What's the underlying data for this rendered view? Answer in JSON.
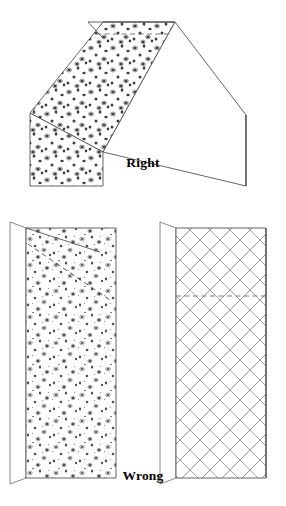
{
  "figure": {
    "kind": "technical-illustration",
    "background_color": "#ffffff",
    "line_color": "#4a4a4a",
    "dash_color": "#6d6d6d",
    "stipple_color": "#555555",
    "hatch_color": "#8c8c8c",
    "caption_color": "#000000"
  },
  "captions": {
    "right": "Right",
    "wrong": "Wrong"
  },
  "panels": {
    "right_example": {
      "label": "Right",
      "description": "Hipped roof with gravel-surfaced left slope and plain right slope",
      "surfaces": [
        {
          "name": "left-slope",
          "fill": "stipple"
        },
        {
          "name": "right-slope",
          "fill": "none"
        },
        {
          "name": "ridge-notch",
          "fill": "none"
        }
      ],
      "ridge_line": true,
      "dashed_guide": true
    },
    "wrong_example_left": {
      "label": "Wrong",
      "description": "Flat upright panel with gravel stipple surface",
      "surfaces": [
        {
          "name": "main-face",
          "fill": "stipple"
        },
        {
          "name": "side-strip",
          "fill": "none"
        }
      ],
      "dashed_guide": true
    },
    "wrong_example_right": {
      "label": "Wrong",
      "description": "Flat upright panel with cross-hatched lattice surface",
      "surfaces": [
        {
          "name": "main-face",
          "fill": "cross-hatch"
        },
        {
          "name": "side-strip",
          "fill": "none"
        }
      ],
      "dashed_guide": true
    }
  }
}
